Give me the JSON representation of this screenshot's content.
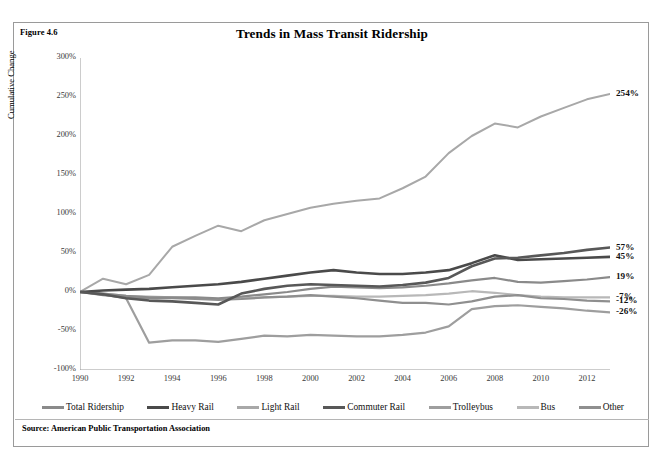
{
  "figure": {
    "label": "Figure 4.6",
    "title": "Trends in Mass Transit Ridership",
    "source": "Source: American Public Transportation Association"
  },
  "chart_data": {
    "type": "line",
    "title": "Trends in Mass Transit Ridership",
    "xlabel": "",
    "ylabel": "Cumulative Change",
    "xlim": [
      1990,
      2013
    ],
    "ylim": [
      -100,
      300
    ],
    "grid": false,
    "legend_position": "bottom",
    "y_ticks": [
      "300%",
      "250%",
      "200%",
      "150%",
      "100%",
      "50%",
      "0%",
      "-50%",
      "-100%"
    ],
    "y_tick_values": [
      300,
      250,
      200,
      150,
      100,
      50,
      0,
      -50,
      -100
    ],
    "x_ticks": [
      "1990",
      "1992",
      "1994",
      "1996",
      "1998",
      "2000",
      "2002",
      "2004",
      "2006",
      "2008",
      "2010",
      "2012"
    ],
    "x_tick_values": [
      1990,
      1992,
      1994,
      1996,
      1998,
      2000,
      2002,
      2004,
      2006,
      2008,
      2010,
      2012
    ],
    "x": [
      1990,
      1991,
      1992,
      1993,
      1994,
      1995,
      1996,
      1997,
      1998,
      1999,
      2000,
      2001,
      2002,
      2003,
      2004,
      2005,
      2006,
      2007,
      2008,
      2009,
      2010,
      2011,
      2012,
      2013
    ],
    "series": [
      {
        "name": "Total Ridership",
        "color": "#8a8a8a",
        "width": 2.2,
        "end_label": "19%",
        "end_value": 19,
        "values": [
          0,
          -2,
          -5,
          -7,
          -7,
          -7,
          -8,
          -6,
          -3,
          0,
          4,
          7,
          6,
          5,
          6,
          8,
          11,
          15,
          18,
          13,
          12,
          14,
          16,
          19
        ]
      },
      {
        "name": "Heavy Rail",
        "color": "#4a4a4a",
        "width": 2.6,
        "end_label": "45%",
        "end_value": 45,
        "values": [
          0,
          2,
          3,
          4,
          6,
          8,
          10,
          13,
          17,
          21,
          25,
          28,
          25,
          23,
          23,
          25,
          28,
          37,
          47,
          41,
          42,
          43,
          44,
          45
        ]
      },
      {
        "name": "Light Rail",
        "color": "#a8a8a8",
        "width": 2.0,
        "end_label": "254%",
        "end_value": 254,
        "values": [
          0,
          17,
          10,
          22,
          58,
          72,
          85,
          78,
          92,
          100,
          108,
          113,
          117,
          120,
          133,
          148,
          178,
          200,
          216,
          211,
          225,
          236,
          247,
          254
        ]
      },
      {
        "name": "Commuter Rail",
        "color": "#585858",
        "width": 2.6,
        "end_label": "57%",
        "end_value": 57,
        "values": [
          0,
          -3,
          -8,
          -11,
          -12,
          -14,
          -16,
          -2,
          4,
          8,
          10,
          9,
          8,
          7,
          9,
          12,
          18,
          33,
          43,
          44,
          47,
          50,
          54,
          57
        ]
      },
      {
        "name": "Trolleybus",
        "color": "#9e9e9e",
        "width": 2.2,
        "end_label": "-26%",
        "end_value": -26,
        "values": [
          0,
          -3,
          -8,
          -65,
          -62,
          -62,
          -64,
          -60,
          -56,
          -57,
          -55,
          -56,
          -57,
          -57,
          -55,
          -52,
          -44,
          -22,
          -18,
          -17,
          -19,
          -21,
          -24,
          -26
        ]
      },
      {
        "name": "Bus",
        "color": "#b8b8b8",
        "width": 2.2,
        "end_label": "-7%",
        "end_value": -7,
        "values": [
          0,
          -2,
          -5,
          -6,
          -7,
          -8,
          -9,
          -8,
          -7,
          -6,
          -5,
          -5,
          -6,
          -6,
          -5,
          -4,
          -2,
          1,
          -1,
          -4,
          -6,
          -7,
          -7,
          -7
        ]
      },
      {
        "name": "Other",
        "color": "#8f8f8f",
        "width": 2.2,
        "end_label": "-12%",
        "end_value": -12,
        "values": [
          0,
          -4,
          -7,
          -8,
          -8,
          -9,
          -10,
          -9,
          -7,
          -6,
          -4,
          -6,
          -8,
          -11,
          -14,
          -14,
          -16,
          -12,
          -6,
          -4,
          -8,
          -9,
          -11,
          -12
        ]
      }
    ]
  },
  "legend": {
    "items": [
      {
        "label": "Total Ridership",
        "color": "#8a8a8a"
      },
      {
        "label": "Heavy Rail",
        "color": "#4a4a4a"
      },
      {
        "label": "Light Rail",
        "color": "#a8a8a8"
      },
      {
        "label": "Commuter Rail",
        "color": "#585858"
      },
      {
        "label": "Trolleybus",
        "color": "#9e9e9e"
      },
      {
        "label": "Bus",
        "color": "#b8b8b8"
      },
      {
        "label": "Other",
        "color": "#8f8f8f"
      }
    ]
  }
}
